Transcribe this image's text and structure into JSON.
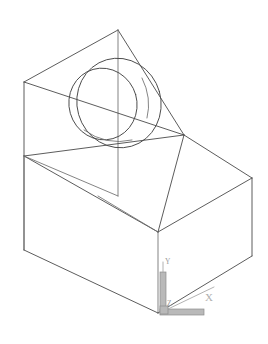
{
  "viewport": {
    "name": "cad-model-viewport",
    "width": 268,
    "height": 344,
    "background_color": "#ffffff",
    "line_color": "#4a4a4a",
    "ucs_color": "#a9a9a9",
    "projection": "isometric",
    "display_style": "2D wireframe"
  },
  "model": {
    "title": "Wireframe solid - rectangular block with chamfered/sloped top face and intersecting cylindrical bosses",
    "solid_name": "box-with-sloped-face-and-cylinders",
    "description": "Isometric wireframe of a rectangular prism whose upper region is cut by an inclined planar face; two overlapping circles (cylinder silhouettes) are projected onto the inclined face."
  },
  "geometry": {
    "box": {
      "name": "rectangular-block",
      "apex_vertex": {
        "x": 118,
        "y": 30
      },
      "left_top_vertex": {
        "x": 24,
        "y": 82
      },
      "left_mid_vertex": {
        "x": 24,
        "y": 156
      },
      "left_bottom_vertex": {
        "x": 24,
        "y": 250
      },
      "front_mid_vertex": {
        "x": 98,
        "y": 196
      },
      "front_bottom_vertex": {
        "x": 158,
        "y": 232
      },
      "front_low_vertex": {
        "x": 158,
        "y": 313
      },
      "right_top_vertex": {
        "x": 252,
        "y": 178
      },
      "right_bottom_vertex": {
        "x": 252,
        "y": 256
      },
      "slope_right_vertex": {
        "x": 184,
        "y": 135
      }
    },
    "circles": [
      {
        "name": "cylinder-silhouette-large",
        "center": {
          "x": 119,
          "y": 103
        },
        "rx": 42,
        "ry": 45,
        "rotation_deg": -16
      },
      {
        "name": "cylinder-silhouette-small",
        "center": {
          "x": 103,
          "y": 104
        },
        "rx": 34,
        "ry": 36,
        "rotation_deg": -16
      }
    ]
  },
  "ucs_icon": {
    "name": "ucs-coordinate-icon",
    "origin": {
      "x": 163,
      "y": 312
    },
    "axes": [
      {
        "label": "Y",
        "direction": "up",
        "tip": {
          "x": 163,
          "y": 262
        }
      },
      {
        "label": "X",
        "direction": "right-up",
        "tip": {
          "x": 212,
          "y": 303
        }
      },
      {
        "label": "Z",
        "direction": "origin-marker",
        "tip": {
          "x": 168,
          "y": 306
        }
      }
    ],
    "labels": {
      "x": "X",
      "y": "Y",
      "z": "Z"
    }
  }
}
